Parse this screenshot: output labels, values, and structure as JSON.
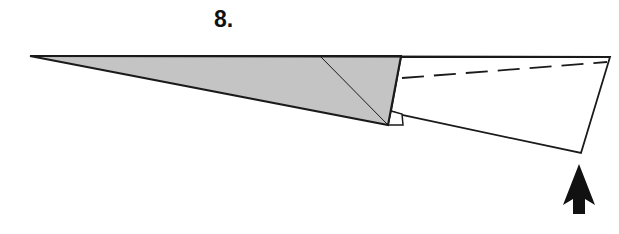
{
  "step": {
    "label": "8."
  },
  "colors": {
    "stroke": "#1a1a1a",
    "shaded_fill": "#c4c4c4",
    "paper_fill": "#ffffff",
    "arrow_fill": "#111111"
  },
  "diagram": {
    "elements": [
      "shaded-section",
      "diagonal-crease",
      "white-flap",
      "small-tab",
      "valley-fold-line",
      "fold-up-arrow"
    ]
  }
}
